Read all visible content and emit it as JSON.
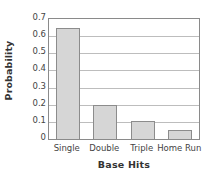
{
  "chart_data": {
    "type": "bar",
    "title": "",
    "subtitle": "",
    "categories": [
      "Single",
      "Double",
      "Triple",
      "Home Run"
    ],
    "values": [
      0.645,
      0.2,
      0.105,
      0.05
    ],
    "xlabel": "Base Hits",
    "ylabel": "Probability",
    "ylim": [
      0,
      0.7
    ],
    "yticks": [
      0,
      0.1,
      0.2,
      0.3,
      0.4,
      0.5,
      0.6,
      0.7
    ],
    "ytick_labels": [
      "0",
      "0.1",
      "0.2",
      "0.3",
      "0.4",
      "0.5",
      "0.6",
      "0.7"
    ],
    "grid": "horizontal",
    "legend": "none",
    "series": [
      {
        "name": "Probability",
        "values": [
          0.645,
          0.2,
          0.105,
          0.05
        ]
      }
    ],
    "colors": {
      "bar_fill": "#d6d6d6",
      "bar_border": "#8c8c8c",
      "gridline": "#bdbdbd",
      "axis": "#8a8a8a",
      "tick_text": "#444444",
      "title_text": "#333333",
      "background": "#ffffff"
    }
  }
}
